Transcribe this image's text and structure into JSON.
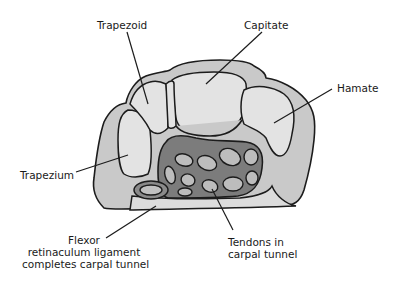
{
  "diagram": {
    "labels": {
      "trapezoid": "Trapezoid",
      "capitate": "Capitate",
      "hamate": "Hamate",
      "trapezium": "Trapezium",
      "flexor_line1": "Flexor",
      "flexor_line2": "retinaculum ligament",
      "flexor_line3": "completes carpal tunnel",
      "tendons_line1": "Tendons in",
      "tendons_line2": "carpal tunnel"
    },
    "colors": {
      "bone_outer": "#c9c9c9",
      "bone_inner": "#e3e3e3",
      "tunnel": "#7c7c7c",
      "tendon": "#bdbdbd",
      "outline": "#1c1c1c",
      "background": "#ffffff"
    }
  }
}
